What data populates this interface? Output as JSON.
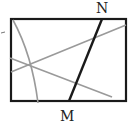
{
  "diagram": {
    "labels": {
      "top_point": "N",
      "bottom_point": "M"
    },
    "colors": {
      "frame": "#1a1a1a",
      "segment_mn": "#1a1a1a",
      "folds": "#9a9a9a",
      "background": "#ffffff"
    }
  }
}
